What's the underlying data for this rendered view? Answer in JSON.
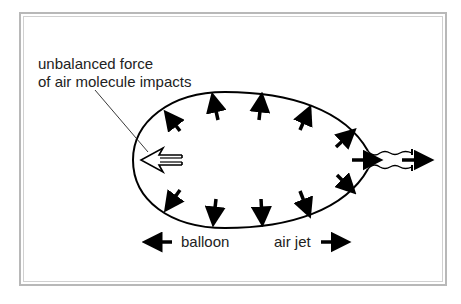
{
  "diagram": {
    "title_label": {
      "line1": "unbalanced force",
      "line2": "of air molecule impacts"
    },
    "legend": {
      "balloon": "balloon",
      "air_jet": "air jet"
    },
    "stroke_color": "#000000",
    "frame_color": "#b8b8b8",
    "inward_arrows": 12,
    "elements": [
      "balloon-outline",
      "neck",
      "air-jet-arrow",
      "net-force-hollow-arrow"
    ]
  }
}
